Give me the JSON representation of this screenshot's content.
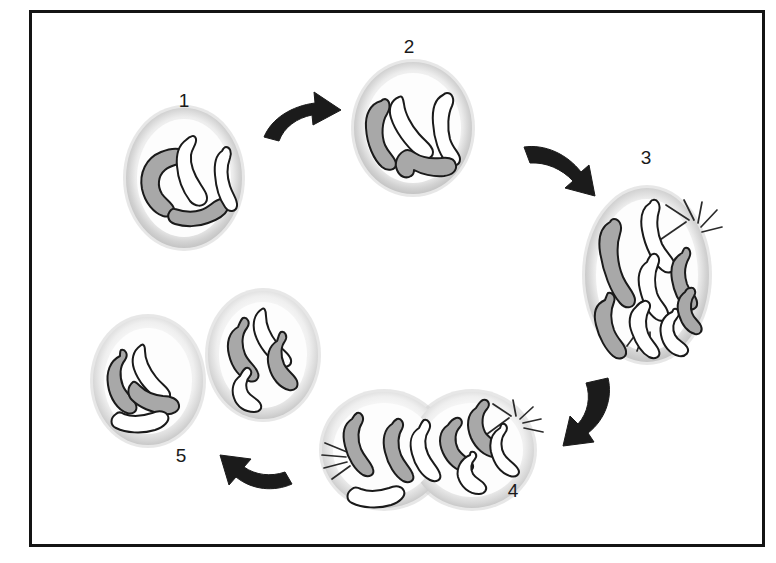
{
  "figure": {
    "border_color": "#141414",
    "background_color": "#ffffff",
    "frame": {
      "x": 30,
      "y": 11,
      "width": 733,
      "height": 534
    }
  },
  "palette": {
    "chromosome_dark_fill": "#a8a8a8",
    "chromosome_light_fill": "#ffffff",
    "chromosome_outline": "#1a1a1a",
    "membrane_outer": "#c9c9c9",
    "membrane_inner": "#f4f4f4",
    "cytoplasm": "#fdfdfd",
    "arrow_fill": "#1b1b1b",
    "spindle_fiber": "#2a2a2a",
    "label_color": "#1a1a1a"
  },
  "stages": [
    {
      "id": "stage-1",
      "label": "1",
      "label_x": 184,
      "label_y": 102,
      "name": "interphase-cell",
      "cell_count": 1,
      "chromosome_count": 4,
      "has_spindle": false,
      "cells": [
        {
          "cx": 184,
          "cy": 178,
          "rx": 58,
          "ry": 70
        }
      ],
      "chromosomes": [
        {
          "shade": "dark",
          "path": "M161 152 C146 158 139 173 142 189 C145 203 154 213 163 216 C170 218 175 214 174 209 C173 203 166 200 162 194 C157 186 158 176 165 170 C172 164 180 165 184 161 C188 157 185 150 179 149 C173 148 166 150 161 152 Z"
        },
        {
          "shade": "light",
          "path": "M186 140 C179 145 176 155 177 166 C178 180 184 193 190 201 C195 207 203 207 206 202 C209 197 205 191 201 185 C195 176 190 164 191 155 C192 148 197 144 196 139 C195 134 190 136 186 140 Z"
        },
        {
          "shade": "dark",
          "path": "M171 210 C166 215 168 222 175 224 C185 227 198 227 208 223 C217 220 225 215 228 209 C231 204 227 198 221 199 C214 200 210 207 201 210 C192 213 181 211 175 209 C173 208 172 209 171 210 Z"
        },
        {
          "shade": "light",
          "path": "M222 151 C216 155 214 164 215 175 C216 188 220 200 225 207 C229 213 236 212 237 206 C238 200 233 195 230 186 C227 177 227 166 230 158 C232 152 230 147 226 147 C224 147 223 149 222 151 Z"
        }
      ]
    },
    {
      "id": "stage-2",
      "label": "2",
      "label_x": 409,
      "label_y": 48,
      "name": "prophase-duplicated-chromosomes",
      "cell_count": 1,
      "chromosome_count": 4,
      "has_spindle": false,
      "cells": [
        {
          "cx": 413,
          "cy": 128,
          "rx": 59,
          "ry": 66
        }
      ],
      "chromosomes": [
        {
          "shade": "dark",
          "path": "M381 101 C370 104 365 115 366 128 C367 145 374 160 382 167 C388 172 396 170 396 164 C396 158 389 154 385 145 C381 135 382 122 387 114 C391 107 390 100 385 99 C383 99 382 100 381 101 Z"
        },
        {
          "shade": "light",
          "path": "M399 97 C391 100 388 109 391 118 C395 131 406 146 417 155 C424 161 433 159 433 152 C433 146 426 142 419 134 C411 125 405 113 404 104 C403 98 402 95 399 97 Z"
        },
        {
          "shade": "light",
          "path": "M443 95 C435 99 432 110 433 123 C434 139 439 154 446 162 C452 168 460 166 460 159 C460 153 453 149 450 139 C447 128 448 114 452 106 C455 99 452 93 447 93 C445 93 444 94 443 95 Z"
        },
        {
          "shade": "dark",
          "path": "M404 151 C397 155 394 163 397 170 C400 177 406 179 411 176 C413 175 414 172 414 170 C421 174 433 177 444 176 C452 175 457 171 456 165 C455 159 449 157 441 158 C431 159 421 157 415 153 C411 150 407 149 404 151 Z"
        }
      ]
    },
    {
      "id": "stage-3",
      "label": "3",
      "label_x": 646,
      "label_y": 159,
      "name": "anaphase-chromosomes-separating",
      "cell_count": 1,
      "chromosome_count": 8,
      "has_spindle": true,
      "cells": [
        {
          "cx": 647,
          "cy": 275,
          "rx": 62,
          "ry": 87
        }
      ],
      "chromosomes": [
        {
          "shade": "dark",
          "path": "M610 222 C601 227 598 238 600 252 C603 272 611 293 620 303 C626 310 635 308 635 300 C635 293 628 288 623 277 C617 263 616 246 620 234 C623 225 619 219 614 219 C612 219 611 220 610 222 Z"
        },
        {
          "shade": "light",
          "path": "M650 203 C642 208 640 218 642 230 C645 247 653 263 662 270 C668 275 676 272 675 265 C674 258 667 254 662 244 C657 233 656 220 659 211 C661 204 657 199 653 200 C651 200 651 201 650 203 Z"
        },
        {
          "shade": "dark",
          "path": "M682 253 C673 258 670 268 672 280 C674 292 679 302 685 307 C691 312 698 309 697 302 C696 295 690 292 687 284 C684 275 685 265 689 258 C692 252 689 247 685 248 C684 248 683 251 682 253 Z"
        },
        {
          "shade": "light",
          "path": "M647 262 C639 267 637 278 640 290 C643 303 649 314 656 319 C662 323 669 320 668 313 C667 306 660 302 657 293 C654 283 655 272 658 265 C661 258 657 253 653 254 C651 254 648 259 647 262 Z"
        },
        {
          "shade": "dark",
          "path": "M605 300 C596 304 593 313 596 325 C599 338 606 350 613 356 C619 361 627 358 626 351 C625 344 618 340 614 330 C610 319 611 309 614 302 C616 296 612 292 608 293 C607 294 606 298 605 300 Z"
        },
        {
          "shade": "light",
          "path": "M636 307 C629 313 628 323 632 333 C636 344 642 353 649 357 C655 360 661 357 659 351 C657 344 651 341 648 333 C645 325 646 316 649 310 C652 304 648 300 644 301 C641 302 638 304 636 307 Z"
        },
        {
          "shade": "light",
          "path": "M672 312 C663 316 659 325 661 335 C663 346 670 354 679 356 C686 357 690 352 687 347 C684 342 678 341 675 335 C672 329 673 322 677 318 C681 313 678 308 674 309 C673 309 673 311 672 312 Z"
        },
        {
          "shade": "dark",
          "path": "M685 292 C678 297 676 306 679 315 C682 325 688 332 695 334 C700 335 703 331 701 326 C699 321 694 319 692 313 C690 307 691 300 694 296 C697 291 694 287 690 288 C688 288 686 290 685 292 Z"
        }
      ],
      "spindle_origin": {
        "x": 690,
        "y": 218
      },
      "spindle_fibers": [
        {
          "x1": 686,
          "y1": 222,
          "x2": 654,
          "y2": 244
        },
        {
          "x1": 689,
          "y1": 220,
          "x2": 666,
          "y2": 205
        },
        {
          "x1": 694,
          "y1": 220,
          "x2": 684,
          "y2": 200
        },
        {
          "x1": 698,
          "y1": 223,
          "x2": 702,
          "y2": 202
        },
        {
          "x1": 701,
          "y1": 227,
          "x2": 717,
          "y2": 210
        },
        {
          "x1": 702,
          "y1": 232,
          "x2": 722,
          "y2": 227
        },
        {
          "x1": 641,
          "y1": 327,
          "x2": 627,
          "y2": 346
        },
        {
          "x1": 645,
          "y1": 330,
          "x2": 637,
          "y2": 351
        },
        {
          "x1": 650,
          "y1": 332,
          "x2": 650,
          "y2": 353
        }
      ]
    },
    {
      "id": "stage-4",
      "label": "4",
      "label_x": 513,
      "label_y": 492,
      "name": "telophase-cytokinesis",
      "cell_count": 2,
      "chromosome_count": 8,
      "has_spindle": true,
      "cells": [
        {
          "cx": 384,
          "cy": 450,
          "rx": 62,
          "ry": 58
        },
        {
          "cx": 472,
          "cy": 450,
          "rx": 62,
          "ry": 58
        }
      ],
      "chromosomes": [
        {
          "shade": "dark",
          "path": "M352 419 C344 424 342 434 345 446 C348 459 355 470 363 475 C369 478 375 475 373 469 C371 462 365 458 361 449 C357 439 358 429 362 423 C365 417 361 412 357 413 C355 414 353 417 352 419 Z"
        },
        {
          "shade": "dark",
          "path": "M392 424 C384 429 382 440 385 452 C388 465 395 476 403 481 C409 484 415 481 413 475 C411 468 405 464 401 455 C397 445 398 435 402 429 C405 423 401 418 397 419 C395 420 393 422 392 424 Z"
        },
        {
          "shade": "light",
          "path": "M419 428 C411 433 409 443 412 454 C415 466 422 476 430 480 C436 483 442 480 440 474 C438 467 432 463 428 454 C424 445 425 436 429 430 C432 424 428 419 424 420 C422 421 420 426 419 428 Z"
        },
        {
          "shade": "dark",
          "path": "M448 425 C439 431 438 442 443 453 C448 464 457 471 465 472 C471 473 475 468 472 463 C469 458 462 456 458 449 C454 441 455 432 460 427 C464 422 461 417 456 418 C453 419 450 422 448 425 Z"
        },
        {
          "shade": "dark",
          "path": "M476 408 C467 414 466 426 471 438 C476 449 485 456 493 457 C499 458 503 453 500 447 C497 441 489 439 485 432 C481 424 482 414 487 409 C491 404 488 399 483 400 C480 401 478 405 476 408 Z"
        },
        {
          "shade": "light",
          "path": "M500 428 C492 433 489 442 491 452 C494 464 501 473 510 476 C516 478 521 474 518 469 C515 463 508 461 504 454 C500 447 501 438 505 433 C509 428 506 423 502 424 C501 424 501 426 500 428 Z"
        },
        {
          "shade": "light",
          "path": "M470 455 C461 459 456 468 458 477 C461 487 469 494 479 494 C485 494 488 489 485 485 C482 480 476 479 473 474 C470 469 471 463 475 459 C478 455 475 451 471 452 C470 453 470 454 470 455 Z"
        },
        {
          "shade": "light",
          "path": "M352 489 C346 493 346 500 352 503 C362 508 378 509 391 505 C400 502 406 496 404 491 C402 486 396 485 389 488 C380 491 369 492 361 489 C357 487 354 487 352 489 Z"
        }
      ],
      "spindle_origin": {
        "x": 513,
        "y": 414
      },
      "spindle_fibers": [
        {
          "x1": 509,
          "y1": 418,
          "x2": 483,
          "y2": 437
        },
        {
          "x1": 511,
          "y1": 416,
          "x2": 493,
          "y2": 404
        },
        {
          "x1": 516,
          "y1": 416,
          "x2": 513,
          "y2": 400
        },
        {
          "x1": 520,
          "y1": 419,
          "x2": 533,
          "y2": 407
        },
        {
          "x1": 523,
          "y1": 423,
          "x2": 541,
          "y2": 419
        },
        {
          "x1": 524,
          "y1": 428,
          "x2": 543,
          "y2": 432
        },
        {
          "x1": 347,
          "y1": 452,
          "x2": 325,
          "y2": 443
        },
        {
          "x1": 346,
          "y1": 457,
          "x2": 322,
          "y2": 455
        },
        {
          "x1": 347,
          "y1": 462,
          "x2": 324,
          "y2": 468
        },
        {
          "x1": 350,
          "y1": 466,
          "x2": 332,
          "y2": 479
        }
      ]
    },
    {
      "id": "stage-5",
      "label": "5",
      "label_x": 181,
      "label_y": 457,
      "name": "two-daughter-cells",
      "cell_count": 2,
      "chromosome_count": 8,
      "has_spindle": false,
      "cells": [
        {
          "cx": 148,
          "cy": 381,
          "rx": 55,
          "ry": 64
        },
        {
          "cx": 263,
          "cy": 355,
          "rx": 55,
          "ry": 64
        }
      ],
      "chromosomes": [
        {
          "shade": "dark",
          "path": "M120 356 C110 361 106 372 108 385 C110 399 118 410 127 413 C133 415 138 411 136 405 C134 398 127 395 123 386 C119 376 120 366 125 360 C129 354 125 349 121 350 C120 351 120 354 120 356 Z"
        },
        {
          "shade": "light",
          "path": "M140 346 C133 351 131 360 134 369 C138 381 148 393 158 399 C164 403 171 400 170 394 C169 388 162 385 156 377 C149 368 145 358 145 351 C145 345 143 343 140 346 Z"
        },
        {
          "shade": "dark",
          "path": "M133 382 C127 387 127 395 132 400 C139 407 152 413 164 414 C173 415 180 411 179 405 C178 399 171 396 163 396 C154 395 145 391 140 386 C137 383 135 381 133 382 Z"
        },
        {
          "shade": "light",
          "path": "M116 414 C110 418 110 425 116 428 C126 433 142 434 155 430 C164 427 170 421 168 416 C166 411 159 410 152 413 C143 416 132 417 124 414 C121 412 118 412 116 414 Z"
        },
        {
          "shade": "dark",
          "path": "M238 327 C229 332 226 343 229 355 C232 368 240 378 249 381 C255 383 260 379 258 373 C256 366 249 363 245 354 C241 344 242 334 247 328 C251 322 247 317 243 318 C241 319 239 325 238 327 Z"
        },
        {
          "shade": "light",
          "path": "M262 309 C254 314 252 324 255 334 C259 347 269 359 279 365 C285 369 292 366 291 360 C290 354 283 351 277 343 C270 334 266 324 266 316 C266 310 264 307 262 309 Z"
        },
        {
          "shade": "dark",
          "path": "M277 341 C269 346 266 356 269 367 C272 379 280 388 289 390 C295 391 299 387 297 381 C295 375 288 372 284 364 C280 355 281 346 285 341 C288 336 285 331 281 332 C279 333 278 339 277 341 Z"
        },
        {
          "shade": "light",
          "path": "M240 376 C233 381 231 390 234 398 C237 407 245 412 254 412 C260 412 263 408 260 403 C257 398 251 397 248 392 C245 387 246 380 250 376 C253 372 250 367 246 368 C244 369 241 374 240 376 Z"
        }
      ]
    }
  ],
  "arrows": [
    {
      "id": "arrow-1-to-2",
      "name": "arrow-stage1-to-stage2",
      "from": "1",
      "to": "2",
      "direction": "right",
      "path": "M264 137 C272 118 292 106 315 103 L314 92 L341 110 L313 125 L312 115 C297 118 284 127 279 141 Z"
    },
    {
      "id": "arrow-2-to-3",
      "name": "arrow-stage2-to-stage3",
      "from": "2",
      "to": "3",
      "direction": "down-right",
      "path": "M524 147 C545 144 567 154 581 172 L589 165 L595 196 L565 188 L573 181 C562 169 546 162 530 163 Z"
    },
    {
      "id": "arrow-3-to-4",
      "name": "arrow-stage3-to-stage4",
      "from": "3",
      "to": "4",
      "direction": "down-left",
      "path": "M608 378 C613 398 605 420 588 433 L594 442 L563 446 L570 416 L578 424 C588 413 591 397 586 383 Z"
    },
    {
      "id": "arrow-4-to-5",
      "name": "arrow-stage4-to-stage5",
      "from": "4",
      "to": "5",
      "direction": "up-left",
      "path": "M292 484 C274 492 252 490 236 477 L229 485 L220 455 L251 459 L244 467 C255 475 271 477 285 472 Z"
    }
  ]
}
